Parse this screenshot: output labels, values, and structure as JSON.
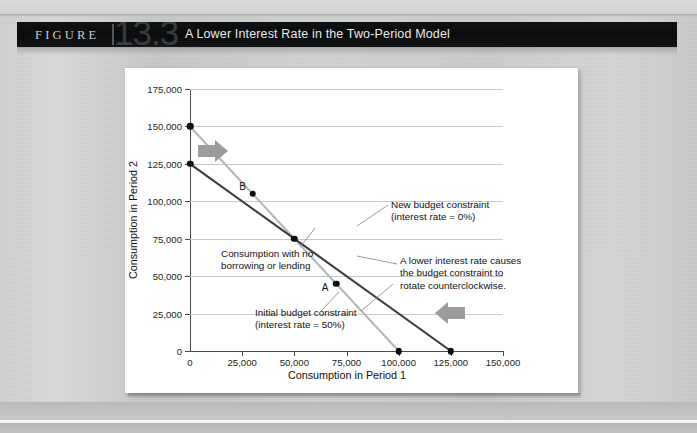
{
  "header": {
    "figure_word": "FIGURE",
    "figure_number": "13.3",
    "title": "A Lower Interest Rate in the Two-Period Model"
  },
  "chart_data": {
    "type": "line",
    "title": "A Lower Interest Rate in the Two-Period Model",
    "xlabel": "Consumption in Period 1",
    "ylabel": "Consumption in Period 2",
    "xlim": [
      0,
      150000
    ],
    "ylim": [
      0,
      175000
    ],
    "grid": true,
    "legend_position": "none",
    "x_ticks": [
      "0",
      "25,000",
      "50,000",
      "75,000",
      "100,000",
      "125,000",
      "150,000"
    ],
    "x_tick_values": [
      0,
      25000,
      50000,
      75000,
      100000,
      125000,
      150000
    ],
    "y_ticks": [
      "0",
      "25,000",
      "50,000",
      "75,000",
      "100,000",
      "125,000",
      "150,000",
      "175,000"
    ],
    "y_tick_values": [
      0,
      25000,
      50000,
      75000,
      100000,
      125000,
      150000,
      175000
    ],
    "series": [
      {
        "name": "Initial budget constraint (interest rate = 50%)",
        "color": "#b5b7b9",
        "x": [
          0,
          100000
        ],
        "y": [
          150000,
          0
        ]
      },
      {
        "name": "New budget constraint (interest rate = 0%)",
        "color": "#3a3d40",
        "x": [
          0,
          125000
        ],
        "y": [
          125000,
          0
        ]
      }
    ],
    "points": [
      {
        "label": "",
        "x": 0,
        "y": 150000
      },
      {
        "label": "",
        "x": 0,
        "y": 125000
      },
      {
        "label": "",
        "x": 50000,
        "y": 75000
      },
      {
        "label": "B",
        "x": 30000,
        "y": 105000
      },
      {
        "label": "A",
        "x": 70000,
        "y": 45000
      },
      {
        "label": "",
        "x": 100000,
        "y": 0
      },
      {
        "label": "",
        "x": 125000,
        "y": 0
      }
    ],
    "annotations": [
      "New budget constraint\n(interest rate = 0%)",
      "Consumption with no\nborrowing or lending",
      "A lower interest rate causes\nthe budget constraint to\nrotate counterclockwise.",
      "Initial budget constraint\n(interest rate = 50%)"
    ]
  },
  "labels": {
    "point_a": "A",
    "point_b": "B",
    "new_budget_constraint": "New budget constraint\n(interest rate = 0%)",
    "no_borrowing": "Consumption with no\nborrowing or lending",
    "rotate_note": "A lower interest rate causes\nthe budget constraint to\nrotate counterclockwise.",
    "initial_budget_constraint": "Initial budget constraint\n(interest rate = 50%)"
  },
  "colors": {
    "initial_line": "#b5b7b9",
    "new_line": "#3a3d40",
    "arrow": "#9a9c9e",
    "grid": "#c6cacd",
    "page_bg": "#c9cbcb",
    "header_bg": "#0d0e0f"
  }
}
